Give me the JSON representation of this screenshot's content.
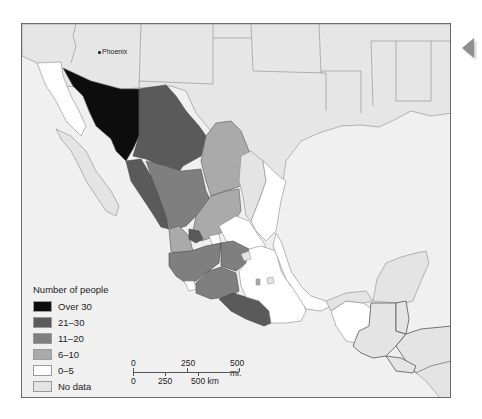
{
  "map": {
    "city_labels": [
      {
        "name": "Phoenix"
      }
    ],
    "colors": {
      "over_30": "#0d0d0d",
      "21_30": "#5a5a5a",
      "11_20": "#7f7f7f",
      "6_10": "#aaaaaa",
      "0_5": "#ffffff",
      "no_data": "#e4e4e4",
      "water": "#efefef",
      "land_other": "#e8e8e8"
    }
  },
  "legend": {
    "title": "Number of people",
    "items": [
      {
        "label": "Over 30",
        "color": "#0d0d0d"
      },
      {
        "label": "21–30",
        "color": "#5a5a5a"
      },
      {
        "label": "11–20",
        "color": "#7f7f7f"
      },
      {
        "label": "6–10",
        "color": "#aaaaaa"
      },
      {
        "label": "0–5",
        "color": "#ffffff"
      },
      {
        "label": "No data",
        "color": "#e4e4e4"
      }
    ]
  },
  "scale_bar": {
    "miles": {
      "zero": "0",
      "mid": "250",
      "end": "500 mi."
    },
    "km": {
      "zero": "0",
      "mid": "250",
      "end": "500 km"
    }
  },
  "nav": {
    "prev_icon": "triangle-left"
  }
}
